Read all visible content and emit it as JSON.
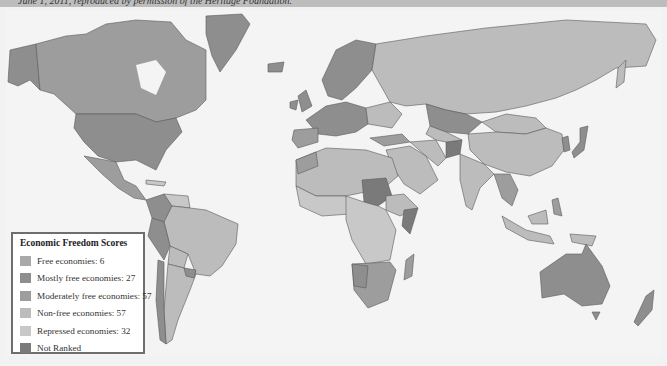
{
  "caption": {
    "text": "June 1, 2011, reproduced by permission of the Heritage Foundation."
  },
  "map": {
    "title": "World map of Economic Freedom Scores",
    "background_color": "#f4f4f4",
    "ocean_color": "#f4f4f4",
    "border_color": "#555555"
  },
  "legend": {
    "title": "Economic Freedom Scores",
    "items": [
      {
        "label": "Free economies: 6",
        "color": "#a9a9a9",
        "count": 6
      },
      {
        "label": "Mostly free economies: 27",
        "color": "#8e8e8e",
        "count": 27
      },
      {
        "label": "Moderately free economies: 57",
        "color": "#9d9d9d",
        "count": 57
      },
      {
        "label": "Non-free economies: 57",
        "color": "#bcbcbc",
        "count": 57
      },
      {
        "label": "Repressed economies: 32",
        "color": "#c8c8c8",
        "count": 32
      },
      {
        "label": "Not Ranked",
        "color": "#7a7a7a",
        "count": null
      }
    ]
  }
}
